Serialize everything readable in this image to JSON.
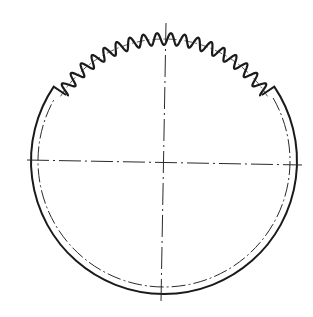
{
  "diagram": {
    "canvas": {
      "width": 313,
      "height": 317,
      "background": "#ffffff"
    },
    "colors": {
      "stroke": "#1a1a1a",
      "centerline": "#2a2a2a"
    },
    "center": {
      "x": 164,
      "y": 161
    },
    "outer_radius": 133,
    "inner_dashdot_radius": 126,
    "pitch_radius": 122,
    "tip_radius": 128,
    "root_radius": 116,
    "teeth": {
      "count": 18,
      "start_angle_deg": -146,
      "end_angle_deg": -34
    },
    "centerlines": {
      "horizontal": {
        "x1": 27,
        "y1": 160,
        "x2": 302,
        "y2": 165
      },
      "vertical": {
        "x1": 166,
        "y1": 23,
        "x2": 161,
        "y2": 302
      }
    }
  }
}
